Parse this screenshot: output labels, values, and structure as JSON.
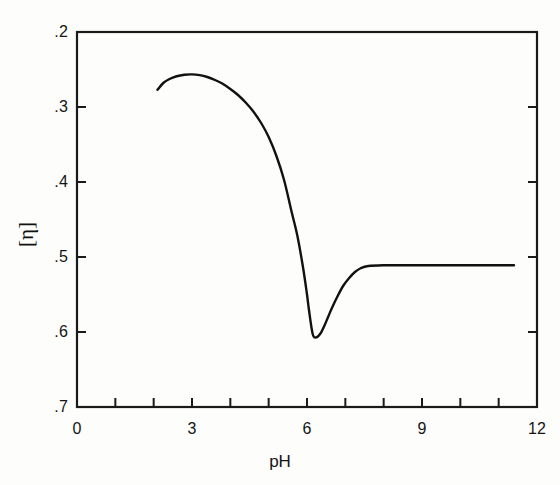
{
  "figure": {
    "background_color": "#fdfdfc",
    "line_color": "#111111",
    "axis_color": "#1a1a1a"
  },
  "axis": {
    "y_title": "[η]",
    "x_title": "pH",
    "y_ticks": [
      ".7",
      ".6",
      ".5",
      ".4",
      ".3",
      ".2"
    ],
    "x_ticks": [
      "0",
      "3",
      "6",
      "9",
      "12"
    ]
  },
  "chart_data": {
    "type": "line",
    "title": "",
    "subtitle": "",
    "xlabel": "pH",
    "ylabel": "[η]",
    "xlim": [
      0,
      12
    ],
    "ylim": [
      0.2,
      0.7
    ],
    "xticks": [
      0,
      3,
      6,
      9,
      12
    ],
    "xminorticks": [
      1,
      2,
      4,
      5,
      7,
      8,
      10,
      11
    ],
    "yticks": [
      0.2,
      0.3,
      0.4,
      0.5,
      0.6,
      0.7
    ],
    "grid": false,
    "legend": null,
    "annotations": [],
    "series": [
      {
        "name": "intrinsic viscosity vs pH",
        "color": "#111111",
        "linewidth": 2.4,
        "x": [
          2.1,
          2.25,
          2.4,
          2.6,
          2.8,
          3.0,
          3.2,
          3.4,
          3.6,
          3.8,
          4.0,
          4.2,
          4.4,
          4.6,
          4.8,
          5.0,
          5.2,
          5.4,
          5.6,
          5.75,
          5.9,
          6.0,
          6.05,
          6.15,
          6.25,
          6.35,
          6.45,
          6.55,
          6.65,
          6.8,
          6.95,
          7.1,
          7.25,
          7.4,
          7.6,
          8.0,
          8.5,
          9.0,
          9.5,
          10.0,
          10.5,
          11.0,
          11.4
        ],
        "y": [
          0.623,
          0.632,
          0.637,
          0.641,
          0.643,
          0.6435,
          0.6425,
          0.64,
          0.636,
          0.631,
          0.624,
          0.616,
          0.606,
          0.594,
          0.579,
          0.56,
          0.535,
          0.503,
          0.46,
          0.428,
          0.385,
          0.35,
          0.33,
          0.297,
          0.293,
          0.298,
          0.308,
          0.32,
          0.332,
          0.348,
          0.362,
          0.372,
          0.38,
          0.385,
          0.388,
          0.389,
          0.389,
          0.389,
          0.389,
          0.389,
          0.389,
          0.389,
          0.389
        ]
      }
    ],
    "notable_points": {
      "start": {
        "x": 2.1,
        "y": 0.623
      },
      "maximum": {
        "x": 3.0,
        "y": 0.6435
      },
      "minimum": {
        "x": 6.25,
        "y": 0.293
      },
      "plateau": {
        "x_from": 7.6,
        "x_to": 11.4,
        "y": 0.389
      }
    }
  }
}
